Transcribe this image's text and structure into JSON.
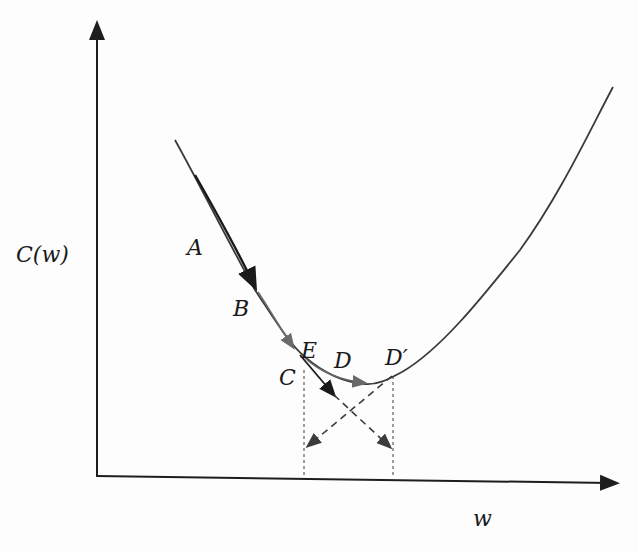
{
  "diagram": {
    "y_axis_label": "C(w)",
    "x_axis_label": "w",
    "colors": {
      "axis": "#1e1e1e",
      "curve": "#3a3a3a",
      "arrow_dark": "#1a1a1a",
      "arrow_gray": "#6a6a6a",
      "dashed": "#3c3c3c",
      "text": "#1a1a1a"
    },
    "points": [
      {
        "id": "A",
        "label": "A"
      },
      {
        "id": "B",
        "label": "B"
      },
      {
        "id": "C",
        "label": "C"
      },
      {
        "id": "E",
        "label": "E"
      },
      {
        "id": "D",
        "label": "D"
      },
      {
        "id": "Dprime",
        "label": "D′"
      }
    ]
  }
}
